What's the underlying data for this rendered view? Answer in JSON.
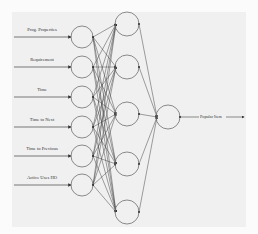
{
  "diagram": {
    "type": "neural-network",
    "inputs": [
      {
        "label": "Prog. Properties",
        "y": 37
      },
      {
        "label": "Requirement",
        "y": 67
      },
      {
        "label": "Time",
        "y": 97
      },
      {
        "label": "Time to Next",
        "y": 127
      },
      {
        "label": "Time to Previous",
        "y": 156
      },
      {
        "label": "Active Uses HO",
        "y": 185
      }
    ],
    "hidden_layer": [
      {
        "y": 24
      },
      {
        "y": 67
      },
      {
        "y": 114
      },
      {
        "y": 164
      },
      {
        "y": 212
      }
    ],
    "output": {
      "label": "Popular Item",
      "y": 117
    },
    "colors": {
      "stroke": "#6e6e6e",
      "edge": "#444444",
      "panel": "#f0f0f0"
    }
  }
}
